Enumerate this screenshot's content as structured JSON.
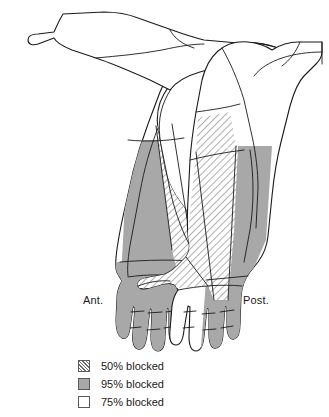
{
  "views": {
    "anterior_label": "Ant.",
    "posterior_label": "Post."
  },
  "legend": {
    "items": [
      {
        "pattern": "diagonal-hatch",
        "label": "50% blocked"
      },
      {
        "pattern": "solid-gray",
        "label": "95% blocked"
      },
      {
        "pattern": "white",
        "label": "75% blocked"
      }
    ]
  },
  "colors": {
    "outline": "#1a1a1a",
    "gray_fill": "#a8a8a8",
    "hatch_line": "#6e6e6e",
    "white_fill": "#ffffff",
    "background": "#ffffff"
  }
}
